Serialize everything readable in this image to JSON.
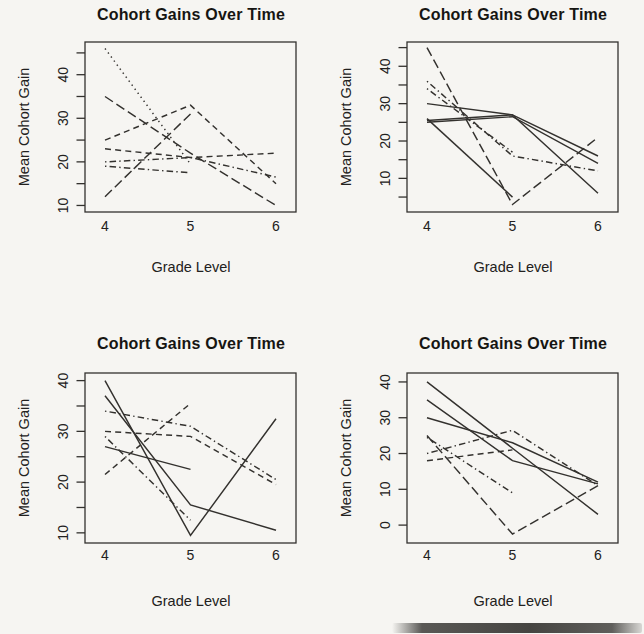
{
  "style": {
    "ink_color": "#33312e",
    "text_color": "#222120",
    "background": "#f6f5f2"
  },
  "chart_data": [
    {
      "type": "line",
      "position": "top-left",
      "title": "Cohort Gains Over Time",
      "xlabel": "Grade Level",
      "ylabel": "Mean Cohort Gain",
      "x": [
        4,
        5,
        6
      ],
      "xtick_labels": [
        "4",
        "5",
        "6"
      ],
      "ylim": [
        8.5,
        47.5
      ],
      "yticks": [
        10,
        15,
        20,
        25,
        30,
        35,
        40,
        45
      ],
      "ytick_labeled": [
        10,
        20,
        30,
        40
      ],
      "grid": false,
      "legend": "none",
      "series": [
        {
          "name": "cohort-1",
          "lty": "dotted",
          "values": [
            46,
            19.5,
            null
          ]
        },
        {
          "name": "cohort-2",
          "lty": "longdash",
          "values": [
            35,
            22,
            10
          ]
        },
        {
          "name": "cohort-3",
          "lty": "dashed",
          "values": [
            25,
            33,
            15
          ]
        },
        {
          "name": "cohort-4",
          "lty": "dashed",
          "values": [
            23,
            21,
            22
          ]
        },
        {
          "name": "cohort-5",
          "lty": "dotdash",
          "values": [
            20,
            21,
            16.5
          ]
        },
        {
          "name": "cohort-6",
          "lty": "dotdash",
          "values": [
            19,
            17.5,
            null
          ]
        },
        {
          "name": "cohort-7",
          "lty": "longdash",
          "values": [
            12,
            31,
            null
          ]
        }
      ]
    },
    {
      "type": "line",
      "position": "top-right",
      "title": "Cohort Gains Over Time",
      "xlabel": "Grade Level",
      "ylabel": "Mean Cohort Gain",
      "x": [
        4,
        5,
        6
      ],
      "xtick_labels": [
        "4",
        "5",
        "6"
      ],
      "ylim": [
        1,
        46.5
      ],
      "yticks": [
        5,
        10,
        15,
        20,
        25,
        30,
        35,
        40,
        45
      ],
      "ytick_labeled": [
        10,
        20,
        30,
        40
      ],
      "grid": false,
      "legend": "none",
      "series": [
        {
          "name": "cohort-1",
          "lty": "longdash",
          "values": [
            45,
            3,
            21
          ]
        },
        {
          "name": "cohort-2",
          "lty": "dotdash",
          "values": [
            36,
            16,
            12
          ]
        },
        {
          "name": "cohort-3",
          "lty": "dotdash",
          "values": [
            34,
            17,
            null
          ]
        },
        {
          "name": "cohort-4",
          "lty": "solid",
          "values": [
            30,
            27,
            16
          ]
        },
        {
          "name": "cohort-5",
          "lty": "solid",
          "values": [
            25,
            26.5,
            14
          ]
        },
        {
          "name": "cohort-6",
          "lty": "solid",
          "values": [
            25.5,
            27,
            6
          ]
        },
        {
          "name": "cohort-7",
          "lty": "solid",
          "values": [
            26,
            5,
            null
          ]
        }
      ]
    },
    {
      "type": "line",
      "position": "bottom-left",
      "title": "Cohort Gains Over Time",
      "xlabel": "Grade Level",
      "ylabel": "Mean Cohort Gain",
      "x": [
        4,
        5,
        6
      ],
      "xtick_labels": [
        "4",
        "5",
        "6"
      ],
      "ylim": [
        8,
        41.5
      ],
      "yticks": [
        10,
        15,
        20,
        25,
        30,
        35,
        40
      ],
      "ytick_labeled": [
        10,
        20,
        30,
        40
      ],
      "grid": false,
      "legend": "none",
      "series": [
        {
          "name": "cohort-1",
          "lty": "solid",
          "values": [
            40,
            9.5,
            32.5
          ]
        },
        {
          "name": "cohort-2",
          "lty": "solid",
          "values": [
            37,
            15.5,
            10.5
          ]
        },
        {
          "name": "cohort-3",
          "lty": "solid",
          "values": [
            27,
            22.5,
            null
          ]
        },
        {
          "name": "cohort-4",
          "lty": "dashed",
          "values": [
            21.5,
            35.5,
            null
          ]
        },
        {
          "name": "cohort-5",
          "lty": "dotdash",
          "values": [
            34,
            31,
            20.5
          ]
        },
        {
          "name": "cohort-6",
          "lty": "dashed",
          "values": [
            30,
            29,
            19.5
          ]
        },
        {
          "name": "cohort-7",
          "lty": "dotdash",
          "values": [
            29,
            12.5,
            null
          ]
        }
      ]
    },
    {
      "type": "line",
      "position": "bottom-right",
      "title": "Cohort Gains Over Time",
      "xlabel": "Grade Level",
      "ylabel": "Mean Cohort Gain",
      "x": [
        4,
        5,
        6
      ],
      "xtick_labels": [
        "4",
        "5",
        "6"
      ],
      "ylim": [
        -5,
        42.5
      ],
      "yticks": [
        0,
        10,
        20,
        30,
        40
      ],
      "ytick_labeled": [
        0,
        10,
        20,
        30,
        40
      ],
      "grid": false,
      "legend": "none",
      "series": [
        {
          "name": "cohort-1",
          "lty": "solid",
          "values": [
            40,
            21.5,
            3
          ]
        },
        {
          "name": "cohort-2",
          "lty": "solid",
          "values": [
            35,
            18,
            11.5
          ]
        },
        {
          "name": "cohort-3",
          "lty": "solid",
          "values": [
            30,
            23,
            12
          ]
        },
        {
          "name": "cohort-4",
          "lty": "dotdash",
          "values": [
            20,
            26.5,
            11
          ]
        },
        {
          "name": "cohort-5",
          "lty": "dotdash",
          "values": [
            24.5,
            9,
            null
          ]
        },
        {
          "name": "cohort-6",
          "lty": "longdash",
          "values": [
            25,
            -2.5,
            11
          ]
        },
        {
          "name": "cohort-7",
          "lty": "dashed",
          "values": [
            18,
            21,
            null
          ]
        }
      ]
    }
  ]
}
